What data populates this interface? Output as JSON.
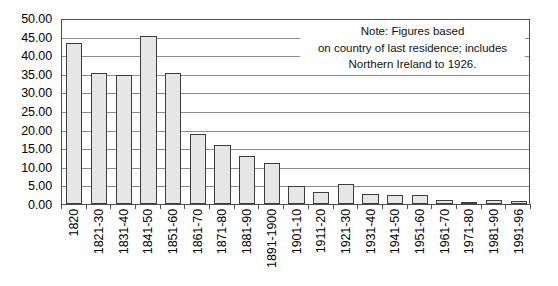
{
  "chart_data": {
    "type": "bar",
    "title": "",
    "subtitle": "",
    "xlabel": "",
    "ylabel": "",
    "ylim": [
      0,
      50
    ],
    "ytick_step": 5,
    "ytick_labels": [
      "50.00",
      "45.00",
      "40.00",
      "35.00",
      "30.00",
      "25.00",
      "20.00",
      "15.00",
      "10.00",
      "5.00",
      "0.00"
    ],
    "ytick_values": [
      50,
      45,
      40,
      35,
      30,
      25,
      20,
      15,
      10,
      5,
      0
    ],
    "grid": true,
    "grid_axis": "y",
    "legend": "none",
    "categories": [
      "1820",
      "1821-30",
      "1831-40",
      "1841-50",
      "1851-60",
      "1861-70",
      "1871-80",
      "1881-90",
      "1891-1900",
      "1901-10",
      "1911-20",
      "1921-30",
      "1931-40",
      "1941-50",
      "1951-60",
      "1961-70",
      "1971-80",
      "1981-90",
      "1991-96"
    ],
    "values": [
      43.4,
      35.3,
      34.6,
      45.1,
      35.2,
      18.9,
      15.9,
      12.8,
      11.0,
      4.8,
      3.2,
      5.5,
      2.7,
      2.5,
      2.4,
      1.2,
      0.4,
      1.0,
      0.9
    ],
    "annotations": [
      {
        "name": "note",
        "lines": [
          "Note: Figures based",
          "on country of last residence; includes",
          "Northern Ireland to 1926."
        ]
      }
    ],
    "colors": {
      "bar_fill": "#e6e6e6",
      "bar_border": "#3d3d3d",
      "gridline": "#8c8c8c",
      "axis": "#4d4d4d",
      "text": "#000000",
      "background": "#ffffff"
    }
  }
}
